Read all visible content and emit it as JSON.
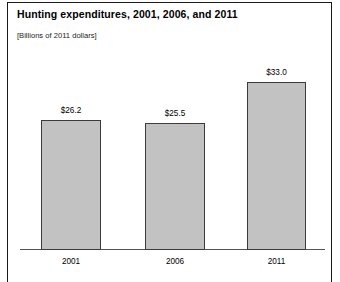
{
  "figure": {
    "title": "Hunting expenditures, 2001, 2006, and 2011",
    "subtitle": "[Billions of 2011 dollars]",
    "border_color": "#1a1a1a",
    "background_color": "#ffffff"
  },
  "chart_data": {
    "type": "bar",
    "title": "Hunting expenditures, 2001, 2006, and 2011",
    "subtitle": "[Billions of 2011 dollars]",
    "categories": [
      "2001",
      "2006",
      "2011"
    ],
    "values": [
      26.2,
      25.5,
      33.0
    ],
    "value_labels": [
      "$26.2",
      "$25.5",
      "$33.0"
    ],
    "xlabel": "",
    "ylabel": "",
    "ylim": [
      0,
      36
    ],
    "grid": false,
    "legend": null,
    "bar_fill_color": "#c2c2c2",
    "bar_edge_color": "#3a3a3a",
    "axis_line_color": "#555555",
    "units": "Billions of 2011 dollars"
  }
}
